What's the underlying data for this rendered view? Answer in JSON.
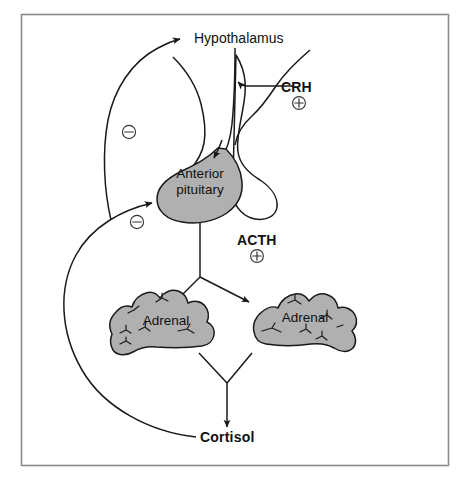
{
  "figure": {
    "border_color": "#808080",
    "background_color": "#ffffff",
    "line_color": "#1a1a1a",
    "organ_fill_color": "#b0b0b0"
  },
  "nodes": {
    "hypothalamus": {
      "label": "Hypothalamus",
      "bold": false
    },
    "anterior_pituitary": {
      "line1": "Anterior",
      "line2": "pituitary",
      "bold": false
    },
    "adrenal_left": {
      "label": "Adrenal",
      "bold": false
    },
    "adrenal_right": {
      "label": "Adrenal",
      "bold": false
    },
    "cortisol": {
      "label": "Cortisol",
      "bold": true
    }
  },
  "hormones": [
    {
      "id": "crh",
      "label": "CRH",
      "sign": "+",
      "sign_glyph": "plus-in-circle",
      "bold": true,
      "from": "hypothalamus-input",
      "to": "hypothalamus"
    },
    {
      "id": "acth",
      "label": "ACTH",
      "sign": "+",
      "sign_glyph": "plus-in-circle",
      "bold": true,
      "from": "anterior_pituitary",
      "to": "adrenals"
    }
  ],
  "feedback": [
    {
      "id": "cortisol-to-hypothalamus",
      "sign": "-",
      "sign_glyph": "minus-in-circle",
      "from": "cortisol",
      "to": "hypothalamus"
    },
    {
      "id": "cortisol-to-pituitary",
      "sign": "-",
      "sign_glyph": "minus-in-circle",
      "from": "cortisol",
      "to": "anterior_pituitary"
    }
  ]
}
